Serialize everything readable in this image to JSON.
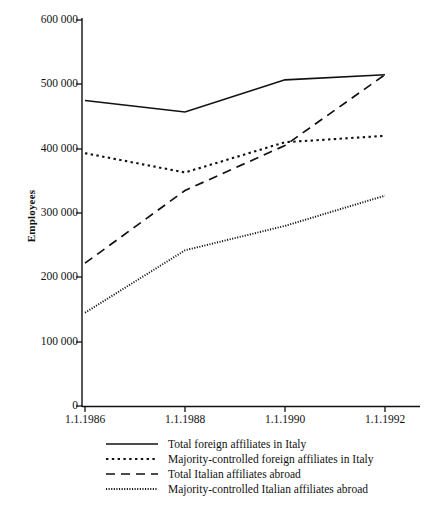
{
  "chart_data": {
    "type": "line",
    "title": "",
    "xlabel": "",
    "ylabel": "Employees",
    "x": [
      "1.1.1986",
      "1.1.1988",
      "1.1.1990",
      "1.1.1992"
    ],
    "categories": [
      "1.1.1986",
      "1.1.1988",
      "1.1.1990",
      "1.1.1992"
    ],
    "ylim": [
      0,
      600000
    ],
    "ytick_values": [
      0,
      100000,
      200000,
      300000,
      400000,
      500000,
      600000
    ],
    "ytick_labels": [
      "0",
      "100 000",
      "200 000",
      "300 000",
      "400 000",
      "500 000",
      "600 000"
    ],
    "xtick_labels": [
      "1.1.1986",
      "1.1.1988",
      "1.1.1990",
      "1.1.1992"
    ],
    "grid": false,
    "legend_position": "below-axis",
    "series": [
      {
        "name": "Total foreign affiliates in Italy",
        "style": "solid",
        "values": [
          475000,
          457000,
          507000,
          515000
        ]
      },
      {
        "name": "Majority-controlled foreign affiliates in Italy",
        "style": "dotted",
        "values": [
          393000,
          363000,
          410000,
          420000
        ]
      },
      {
        "name": "Total Italian affiliates abroad",
        "style": "dashed",
        "values": [
          222000,
          335000,
          405000,
          515000
        ]
      },
      {
        "name": "Majority-controlled Italian affiliates abroad",
        "style": "fine-dotted",
        "values": [
          145000,
          242000,
          280000,
          327000
        ]
      }
    ]
  },
  "colors": {
    "line": "#111111",
    "axis": "#111111",
    "background": "#ffffff"
  }
}
